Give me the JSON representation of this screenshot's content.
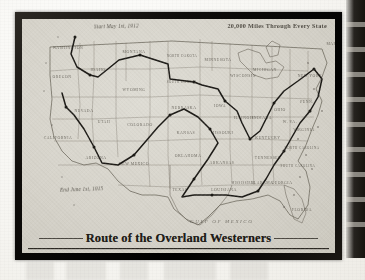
{
  "document": {
    "type": "scanned-book-page",
    "title": "Route of the Overland Westerners",
    "captions": {
      "start": "Start May 1st, 1912",
      "subtitle": "20,000 Miles Through Every State",
      "end": "End June 1st, 1915"
    }
  },
  "map": {
    "region": "United States of America",
    "ocean_labels": [
      {
        "name": "gulf-of-mexico",
        "text": "GULF OF MEXICO"
      }
    ],
    "states": [
      {
        "abbr": "WA",
        "name": "WASHINGTON",
        "x": 46,
        "y": 30
      },
      {
        "abbr": "OR",
        "name": "OREGON",
        "x": 40,
        "y": 59
      },
      {
        "abbr": "CA",
        "name": "CALIFORNIA",
        "x": 36,
        "y": 120
      },
      {
        "abbr": "NV",
        "name": "NEVADA",
        "x": 62,
        "y": 93
      },
      {
        "abbr": "ID",
        "name": "IDAHO",
        "x": 76,
        "y": 52
      },
      {
        "abbr": "MT",
        "name": "MONTANA",
        "x": 112,
        "y": 34
      },
      {
        "abbr": "WY",
        "name": "WYOMING",
        "x": 112,
        "y": 72
      },
      {
        "abbr": "UT",
        "name": "UTAH",
        "x": 82,
        "y": 104
      },
      {
        "abbr": "AZ",
        "name": "ARIZONA",
        "x": 74,
        "y": 140
      },
      {
        "abbr": "CO",
        "name": "COLORADO",
        "x": 118,
        "y": 107
      },
      {
        "abbr": "NM",
        "name": "NEW MEXICO",
        "x": 112,
        "y": 146
      },
      {
        "abbr": "ND",
        "name": "NORTH DAKOTA",
        "x": 160,
        "y": 38
      },
      {
        "abbr": "SD",
        "name": "SOUTH DAKOTA",
        "x": 160,
        "y": 64
      },
      {
        "abbr": "NE",
        "name": "NEBRASKA",
        "x": 162,
        "y": 90
      },
      {
        "abbr": "KS",
        "name": "KANSAS",
        "x": 164,
        "y": 115
      },
      {
        "abbr": "OK",
        "name": "OKLAHOMA",
        "x": 166,
        "y": 138
      },
      {
        "abbr": "TX",
        "name": "TEXAS",
        "x": 158,
        "y": 172
      },
      {
        "abbr": "MN",
        "name": "MINNESOTA",
        "x": 196,
        "y": 42
      },
      {
        "abbr": "IA",
        "name": "IOWA",
        "x": 198,
        "y": 88
      },
      {
        "abbr": "MO",
        "name": "MISSOURI",
        "x": 200,
        "y": 115
      },
      {
        "abbr": "AR",
        "name": "ARKANSAS",
        "x": 200,
        "y": 145
      },
      {
        "abbr": "LA",
        "name": "LOUISIANA",
        "x": 202,
        "y": 172
      },
      {
        "abbr": "WI",
        "name": "WISCONSIN",
        "x": 221,
        "y": 58
      },
      {
        "abbr": "IL",
        "name": "ILLINOIS",
        "x": 222,
        "y": 100
      },
      {
        "abbr": "MS",
        "name": "MISSISSIPPI",
        "x": 221,
        "y": 165
      },
      {
        "abbr": "MI",
        "name": "MICHIGAN",
        "x": 243,
        "y": 52
      },
      {
        "abbr": "IN",
        "name": "INDIANA",
        "x": 240,
        "y": 100
      },
      {
        "abbr": "KY",
        "name": "KENTUCKY",
        "x": 246,
        "y": 120
      },
      {
        "abbr": "TN",
        "name": "TENNESSEE",
        "x": 246,
        "y": 140
      },
      {
        "abbr": "AL",
        "name": "ALABAMA",
        "x": 240,
        "y": 165
      },
      {
        "abbr": "OH",
        "name": "OHIO",
        "x": 258,
        "y": 92
      },
      {
        "abbr": "GA",
        "name": "GEORGIA",
        "x": 260,
        "y": 165
      },
      {
        "abbr": "FL",
        "name": "FLORIDA",
        "x": 280,
        "y": 192
      },
      {
        "abbr": "SC",
        "name": "SOUTH CAROLINA",
        "x": 276,
        "y": 148
      },
      {
        "abbr": "NC",
        "name": "NORTH CAROLINA",
        "x": 280,
        "y": 130
      },
      {
        "abbr": "VA",
        "name": "VIRGINIA",
        "x": 282,
        "y": 112
      },
      {
        "abbr": "WV",
        "name": "W. VA.",
        "x": 268,
        "y": 104
      },
      {
        "abbr": "PA",
        "name": "PENN.",
        "x": 285,
        "y": 84
      },
      {
        "abbr": "NY",
        "name": "NEW YORK",
        "x": 288,
        "y": 58
      },
      {
        "abbr": "ME",
        "name": "MAINE",
        "x": 312,
        "y": 26
      }
    ],
    "route": {
      "label": "overland-westerners-route",
      "color": "#1c1a16",
      "waypoints": [
        [
          53,
          18
        ],
        [
          49,
          35
        ],
        [
          55,
          48
        ],
        [
          68,
          56
        ],
        [
          76,
          58
        ],
        [
          97,
          41
        ],
        [
          118,
          36
        ],
        [
          146,
          45
        ],
        [
          148,
          60
        ],
        [
          172,
          63
        ],
        [
          180,
          66
        ],
        [
          196,
          70
        ],
        [
          203,
          82
        ],
        [
          215,
          92
        ],
        [
          220,
          104
        ],
        [
          228,
          120
        ],
        [
          238,
          112
        ],
        [
          246,
          96
        ],
        [
          252,
          84
        ],
        [
          262,
          72
        ],
        [
          276,
          62
        ],
        [
          292,
          50
        ],
        [
          300,
          60
        ],
        [
          296,
          78
        ],
        [
          288,
          92
        ],
        [
          278,
          104
        ],
        [
          270,
          118
        ],
        [
          262,
          132
        ],
        [
          252,
          146
        ],
        [
          244,
          160
        ],
        [
          236,
          172
        ],
        [
          220,
          178
        ],
        [
          204,
          176
        ],
        [
          190,
          176
        ],
        [
          172,
          176
        ],
        [
          160,
          178
        ],
        [
          172,
          160
        ],
        [
          186,
          140
        ],
        [
          196,
          124
        ],
        [
          188,
          110
        ],
        [
          176,
          98
        ],
        [
          162,
          90
        ],
        [
          148,
          96
        ],
        [
          136,
          108
        ],
        [
          124,
          122
        ],
        [
          112,
          136
        ],
        [
          96,
          146
        ],
        [
          80,
          144
        ],
        [
          72,
          128
        ],
        [
          62,
          110
        ],
        [
          52,
          96
        ],
        [
          44,
          88
        ],
        [
          40,
          74
        ]
      ]
    }
  }
}
